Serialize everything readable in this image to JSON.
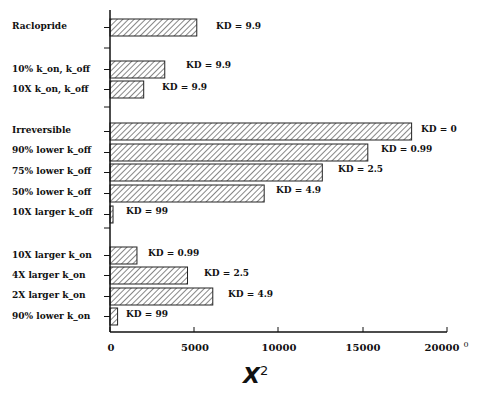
{
  "chart_data": {
    "type": "bar",
    "orientation": "horizontal",
    "title": "",
    "xlabel": "χ²",
    "ylabel": "",
    "xlim": [
      0,
      20000
    ],
    "xticks": [
      "0",
      "5000",
      "10000",
      "15000",
      "20000"
    ],
    "grid": false,
    "bar_pattern": "diagonal-hatch",
    "groups": [
      {
        "name": "Raclopride",
        "items": [
          "Raclopride"
        ]
      },
      {
        "name": "scaled rates",
        "items": [
          "10% k_on, k_off",
          "10X k_on, k_off"
        ]
      },
      {
        "name": "k_off variants",
        "items": [
          "Irreversible",
          "90% lower k_off",
          "75% lower k_off",
          "50% lower k_off",
          "10X larger k_off"
        ]
      },
      {
        "name": "k_on variants",
        "items": [
          "10X larger k_on",
          "4X larger k_on",
          "2X larger k_on",
          "90% lower k_on"
        ]
      }
    ],
    "categories": [
      "Raclopride",
      "10% k_on, k_off",
      "10X k_on, k_off",
      "Irreversible",
      "90% lower k_off",
      "75% lower k_off",
      "50% lower k_off",
      "10X larger k_off",
      "10X larger k_on",
      "4X larger k_on",
      "2X larger k_on",
      "90% lower k_on"
    ],
    "values": [
      5150,
      3250,
      2000,
      17900,
      15300,
      12600,
      9150,
      180,
      1600,
      4600,
      6100,
      450
    ],
    "annotations": [
      "KD = 9.9",
      "KD = 9.9",
      "KD = 9.9",
      "KD = 0",
      "KD = 0.99",
      "KD = 2.5",
      "KD = 4.9",
      "KD = 99",
      "KD = 0.99",
      "KD = 2.5",
      "KD = 4.9",
      "KD = 99"
    ]
  },
  "labels": {
    "raclopride": "Raclopride",
    "c1": "10% k_on, k_off",
    "c2": "10X k_on, k_off",
    "c3": "Irreversible",
    "c4": "90% lower k_off",
    "c5": "75% lower k_off",
    "c6": "50% lower k_off",
    "c7": "10X  larger k_off",
    "c8": "10X larger k_on",
    "c9": "4X  larger k_on",
    "c10": "2X  larger k_on",
    "c11": "90% lower k_on"
  },
  "kd": {
    "k0": "KD = 9.9",
    "k1": "KD = 9.9",
    "k2": "KD = 9.9",
    "k3": "KD = 0",
    "k4": "KD = 0.99",
    "k5": "KD = 2.5",
    "k6": "KD = 4.9",
    "k7": "KD = 99",
    "k8": "KD = 0.99",
    "k9": "KD = 2.5",
    "k10": "KD = 4.9",
    "k11": "KD = 99"
  },
  "ticks": {
    "t0": "0",
    "t1": "5000",
    "t2": "10000",
    "t3": "15000",
    "t4": "20000",
    "stray": "0"
  },
  "axis": {
    "xlabel_base": "X",
    "xlabel_sup": "2"
  }
}
